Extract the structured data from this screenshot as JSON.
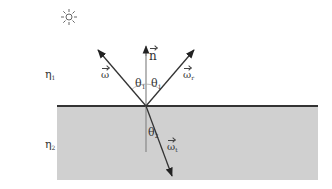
{
  "diagram": {
    "colors": {
      "background": "#ffffff",
      "medium2_fill": "#d0d0d0",
      "interface_line": "#333333",
      "rays": "#333333",
      "normal": "#888888",
      "arc": "#aaaaaa"
    },
    "icons": {
      "light_source": "sun-icon"
    },
    "labels": {
      "eta1": {
        "symbol": "η",
        "sub": "1"
      },
      "eta2": {
        "symbol": "η",
        "sub": "2"
      },
      "normal": {
        "symbol": "n"
      },
      "incident": {
        "symbol": "ω"
      },
      "reflected": {
        "symbol": "ω",
        "sub": "r"
      },
      "transmitted": {
        "symbol": "ω",
        "sub": "t"
      },
      "theta1_left": {
        "symbol": "θ",
        "sub": "1"
      },
      "theta1_right": {
        "symbol": "θ",
        "sub": "1"
      },
      "theta2": {
        "symbol": "θ",
        "sub": "2"
      }
    },
    "geometry": {
      "interface_y": 106,
      "interface_x": [
        57,
        318
      ],
      "origin": [
        146,
        106
      ],
      "medium2_rect": {
        "x": 57,
        "y": 106,
        "w": 261,
        "h": 74
      },
      "incident_end": [
        98,
        50
      ],
      "reflected_end": [
        194,
        50
      ],
      "normal_top": [
        146,
        45
      ],
      "normal_bottom": [
        146,
        152
      ],
      "transmitted_end": [
        172,
        176
      ],
      "sun_center": [
        69,
        17
      ]
    }
  }
}
